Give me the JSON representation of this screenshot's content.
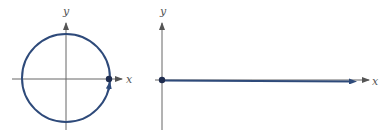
{
  "figures": [
    {
      "name": "unit-circle-path",
      "x_label": "x",
      "y_label": "y",
      "description": "Circle traced counterclockwise starting at point on positive x-axis"
    },
    {
      "name": "horizontal-path",
      "x_label": "x",
      "y_label": "y",
      "description": "Path along positive x-axis starting at origin"
    }
  ],
  "colors": {
    "curve": "#2e4a7a",
    "axis": "#666666",
    "dot": "#1f2d4f"
  }
}
